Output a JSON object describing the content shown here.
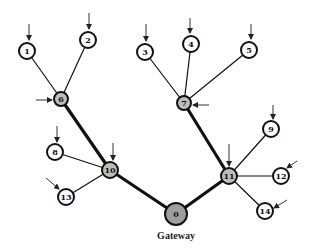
{
  "diagram": {
    "title_label": "Gateway",
    "colors": {
      "leaf_fill": "#ffffff",
      "relay_fill": "#bdbdbd",
      "gateway_fill": "#9e9e9e",
      "stroke": "#111111"
    },
    "nodes": [
      {
        "id": "0",
        "label": "0",
        "x": 176,
        "y": 214,
        "r": 11,
        "type": "gateway"
      },
      {
        "id": "1",
        "label": "1",
        "x": 27,
        "y": 51,
        "r": 8,
        "type": "leaf"
      },
      {
        "id": "2",
        "label": "2",
        "x": 88,
        "y": 40,
        "r": 8,
        "type": "leaf"
      },
      {
        "id": "3",
        "label": "3",
        "x": 145,
        "y": 52,
        "r": 8,
        "type": "leaf"
      },
      {
        "id": "4",
        "label": "4",
        "x": 191,
        "y": 44,
        "r": 8,
        "type": "leaf"
      },
      {
        "id": "5",
        "label": "5",
        "x": 249,
        "y": 50,
        "r": 8,
        "type": "leaf"
      },
      {
        "id": "6",
        "label": "6",
        "x": 61,
        "y": 99,
        "r": 7,
        "type": "relay"
      },
      {
        "id": "7",
        "label": "7",
        "x": 184,
        "y": 103,
        "r": 7,
        "type": "relay"
      },
      {
        "id": "8",
        "label": "8",
        "x": 55,
        "y": 152,
        "r": 8,
        "type": "leaf"
      },
      {
        "id": "9",
        "label": "9",
        "x": 271,
        "y": 129,
        "r": 8,
        "type": "leaf"
      },
      {
        "id": "10",
        "label": "10",
        "x": 110,
        "y": 170,
        "r": 8,
        "type": "relay"
      },
      {
        "id": "11",
        "label": "11",
        "x": 229,
        "y": 176,
        "r": 8,
        "type": "relay"
      },
      {
        "id": "12",
        "label": "12",
        "x": 281,
        "y": 176,
        "r": 8,
        "type": "leaf"
      },
      {
        "id": "13",
        "label": "13",
        "x": 66,
        "y": 197,
        "r": 8,
        "type": "leaf"
      },
      {
        "id": "14",
        "label": "14",
        "x": 265,
        "y": 211,
        "r": 8,
        "type": "leaf"
      }
    ],
    "edges": [
      {
        "from": "1",
        "to": "6",
        "weight": "thin"
      },
      {
        "from": "2",
        "to": "6",
        "weight": "thin"
      },
      {
        "from": "3",
        "to": "7",
        "weight": "thin"
      },
      {
        "from": "4",
        "to": "7",
        "weight": "thin"
      },
      {
        "from": "5",
        "to": "7",
        "weight": "thin"
      },
      {
        "from": "8",
        "to": "10",
        "weight": "thin"
      },
      {
        "from": "13",
        "to": "10",
        "weight": "thin"
      },
      {
        "from": "9",
        "to": "11",
        "weight": "thin"
      },
      {
        "from": "12",
        "to": "11",
        "weight": "thin"
      },
      {
        "from": "14",
        "to": "11",
        "weight": "thin"
      },
      {
        "from": "6",
        "to": "10",
        "weight": "thick"
      },
      {
        "from": "7",
        "to": "11",
        "weight": "thick"
      },
      {
        "from": "10",
        "to": "0",
        "weight": "thick"
      },
      {
        "from": "11",
        "to": "0",
        "weight": "thick"
      }
    ],
    "arrows": [
      {
        "to": "1",
        "x1": 29,
        "y1": 24,
        "x2": 29,
        "y2": 40
      },
      {
        "to": "2",
        "x1": 89,
        "y1": 13,
        "x2": 89,
        "y2": 29
      },
      {
        "to": "3",
        "x1": 146,
        "y1": 24,
        "x2": 146,
        "y2": 41
      },
      {
        "to": "4",
        "x1": 190,
        "y1": 18,
        "x2": 190,
        "y2": 33
      },
      {
        "to": "5",
        "x1": 251,
        "y1": 24,
        "x2": 251,
        "y2": 39
      },
      {
        "to": "6",
        "x1": 36,
        "y1": 100,
        "x2": 52,
        "y2": 100
      },
      {
        "to": "7",
        "x1": 209,
        "y1": 105,
        "x2": 193,
        "y2": 105
      },
      {
        "to": "8",
        "x1": 57,
        "y1": 126,
        "x2": 57,
        "y2": 142
      },
      {
        "to": "10",
        "x1": 113,
        "y1": 143,
        "x2": 113,
        "y2": 160
      },
      {
        "to": "13",
        "x1": 46,
        "y1": 178,
        "x2": 59,
        "y2": 189
      },
      {
        "to": "9",
        "x1": 273,
        "y1": 105,
        "x2": 273,
        "y2": 119
      },
      {
        "to": "11",
        "x1": 229,
        "y1": 144,
        "x2": 229,
        "y2": 166
      },
      {
        "to": "12",
        "x1": 297,
        "y1": 161,
        "x2": 287,
        "y2": 168
      },
      {
        "to": "14",
        "x1": 287,
        "y1": 200,
        "x2": 274,
        "y2": 208
      }
    ]
  }
}
